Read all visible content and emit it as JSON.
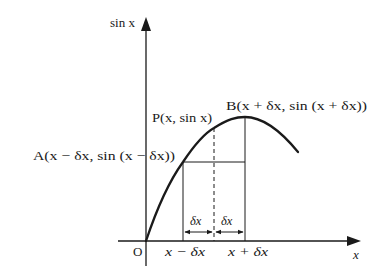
{
  "diagram": {
    "axes": {
      "y_label": "sin x",
      "x_label": "x",
      "origin_label": "O"
    },
    "curve": {
      "function": "sin x",
      "description": "Arc of the sine curve rising from the origin, peaking near B, then descending"
    },
    "points": {
      "A": {
        "label": "A(x − δx, sin (x − δx))"
      },
      "P": {
        "label": "P(x, sin x)"
      },
      "B": {
        "label": "B(x + δx, sin (x + δx))"
      }
    },
    "x_ticks": {
      "left": "x − δx",
      "right": "x + δx"
    },
    "intervals": {
      "left": "δx",
      "right": "δx"
    },
    "colors": {
      "line": "#1a1a1a",
      "background": "#ffffff"
    }
  }
}
